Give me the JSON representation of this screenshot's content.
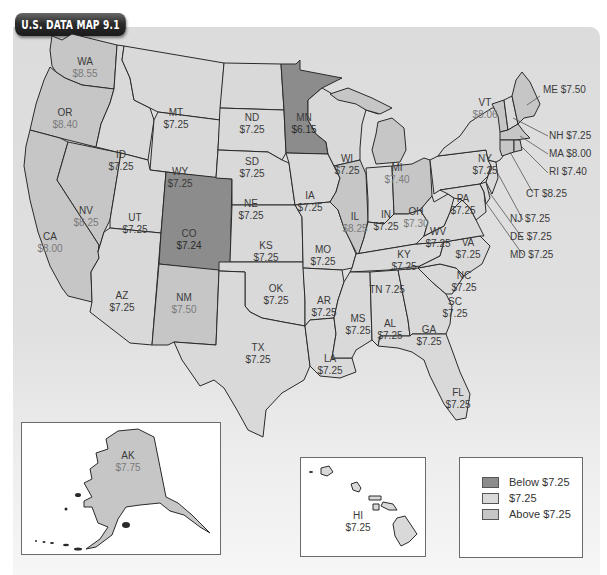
{
  "title": "U.S. DATA MAP 9.1",
  "colors": {
    "below": "#8c8c8c",
    "equal": "#d9d9d9",
    "above": "#c6c6c6",
    "border": "#2a2a2a",
    "background": "#dcdcdc"
  },
  "legend": {
    "items": [
      {
        "label": "Below $7.25",
        "category": "below"
      },
      {
        "label": "$7.25",
        "category": "equal"
      },
      {
        "label": "Above $7.25",
        "category": "above"
      }
    ]
  },
  "states": {
    "WA": {
      "abbr": "WA",
      "value": "$8.55",
      "category": "above"
    },
    "OR": {
      "abbr": "OR",
      "value": "$8.40",
      "category": "above"
    },
    "CA": {
      "abbr": "CA",
      "value": "$8.00",
      "category": "above"
    },
    "NV": {
      "abbr": "NV",
      "value": "$8.25",
      "category": "above"
    },
    "ID": {
      "abbr": "ID",
      "value": "$7.25",
      "category": "equal"
    },
    "MT": {
      "abbr": "MT",
      "value": "$7.25",
      "category": "equal"
    },
    "WY": {
      "abbr": "WY",
      "value": "$7.25",
      "category": "equal"
    },
    "UT": {
      "abbr": "UT",
      "value": "$7.25",
      "category": "equal"
    },
    "AZ": {
      "abbr": "AZ",
      "value": "$7.25",
      "category": "equal"
    },
    "CO": {
      "abbr": "CO",
      "value": "$7.24",
      "category": "below"
    },
    "NM": {
      "abbr": "NM",
      "value": "$7.50",
      "category": "above"
    },
    "ND": {
      "abbr": "ND",
      "value": "$7.25",
      "category": "equal"
    },
    "SD": {
      "abbr": "SD",
      "value": "$7.25",
      "category": "equal"
    },
    "NE": {
      "abbr": "NE",
      "value": "$7.25",
      "category": "equal"
    },
    "KS": {
      "abbr": "KS",
      "value": "$7.25",
      "category": "equal"
    },
    "OK": {
      "abbr": "OK",
      "value": "$7.25",
      "category": "equal"
    },
    "TX": {
      "abbr": "TX",
      "value": "$7.25",
      "category": "equal"
    },
    "MN": {
      "abbr": "MN",
      "value": "$6.15",
      "category": "below"
    },
    "IA": {
      "abbr": "IA",
      "value": "$7.25",
      "category": "equal"
    },
    "MO": {
      "abbr": "MO",
      "value": "$7.25",
      "category": "equal"
    },
    "AR": {
      "abbr": "AR",
      "value": "$7.25",
      "category": "equal"
    },
    "LA": {
      "abbr": "LA",
      "value": "$7.25",
      "category": "equal"
    },
    "WI": {
      "abbr": "WI",
      "value": "$7.25",
      "category": "equal"
    },
    "IL": {
      "abbr": "IL",
      "value": "$8.25",
      "category": "above"
    },
    "MI": {
      "abbr": "MI",
      "value": "$7.40",
      "category": "above"
    },
    "IN": {
      "abbr": "IN",
      "value": "$7.25",
      "category": "equal"
    },
    "OH": {
      "abbr": "OH",
      "value": "$7.30",
      "category": "above"
    },
    "KY": {
      "abbr": "KY",
      "value": "$7.25",
      "category": "equal"
    },
    "TN": {
      "abbr": "TN",
      "value": "7.25",
      "category": "equal",
      "text": "TN 7.25"
    },
    "MS": {
      "abbr": "MS",
      "value": "$7.25",
      "category": "equal"
    },
    "AL": {
      "abbr": "AL",
      "value": "$7.25",
      "category": "equal"
    },
    "GA": {
      "abbr": "GA",
      "value": "$7.25",
      "category": "equal"
    },
    "FL": {
      "abbr": "FL",
      "value": "$7.25",
      "category": "equal"
    },
    "SC": {
      "abbr": "SC",
      "value": "$7.25",
      "category": "equal"
    },
    "NC": {
      "abbr": "NC",
      "value": "$7.25",
      "category": "equal"
    },
    "VA": {
      "abbr": "VA",
      "value": "$7.25",
      "category": "equal"
    },
    "WV": {
      "abbr": "WV",
      "value": "$7.25",
      "category": "equal"
    },
    "PA": {
      "abbr": "PA",
      "value": "$7.25",
      "category": "equal"
    },
    "NY": {
      "abbr": "NY",
      "value": "$7.25",
      "category": "equal"
    },
    "VT": {
      "abbr": "VT",
      "value": "$8.06",
      "category": "above"
    },
    "ME": {
      "abbr": "ME",
      "value": "$7.50",
      "category": "above",
      "text": "ME $7.50"
    },
    "NH": {
      "abbr": "NH",
      "value": "$7.25",
      "category": "equal",
      "text": "NH $7.25"
    },
    "MA": {
      "abbr": "MA",
      "value": "$8.00",
      "category": "above",
      "text": "MA $8.00"
    },
    "RI": {
      "abbr": "RI",
      "value": "$7.40",
      "category": "above",
      "text": "RI $7.40"
    },
    "CT": {
      "abbr": "CT",
      "value": "$8.25",
      "category": "above",
      "text": "CT $8.25"
    },
    "NJ": {
      "abbr": "NJ",
      "value": "$7.25",
      "category": "equal",
      "text": "NJ $7.25"
    },
    "DE": {
      "abbr": "DE",
      "value": "$7.25",
      "category": "equal",
      "text": "DE $7.25"
    },
    "MD": {
      "abbr": "MD",
      "value": "$7.25",
      "category": "equal",
      "text": "MD $7.25"
    },
    "AK": {
      "abbr": "AK",
      "value": "$7.75",
      "category": "above"
    },
    "HI": {
      "abbr": "HI",
      "value": "$7.25",
      "category": "equal"
    }
  }
}
